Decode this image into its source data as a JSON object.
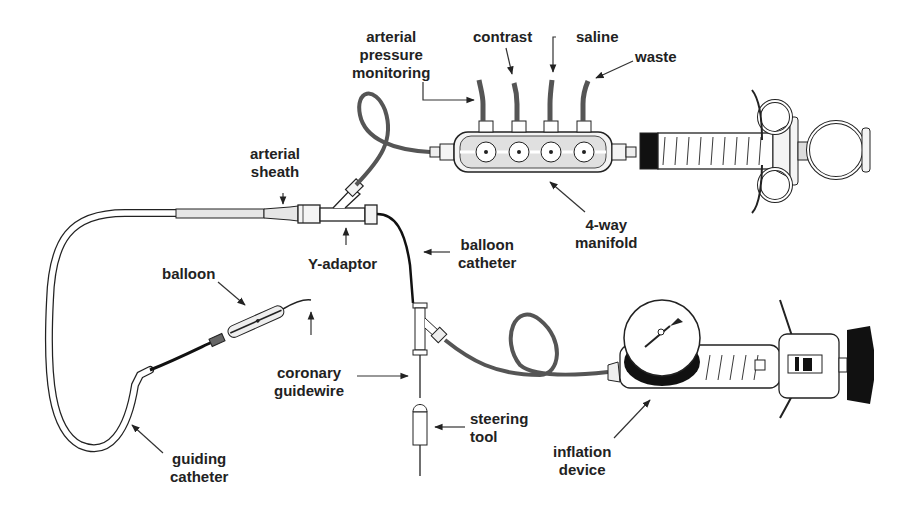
{
  "diagram": {
    "colors": {
      "ink": "#222222",
      "tube": "#555555",
      "fill_light": "#e6e6e6",
      "fill_dark": "#111111",
      "background": "#ffffff"
    },
    "labels": {
      "arterial_pressure_monitoring": {
        "line1": "arterial",
        "line2": "pressure",
        "line3": "monitoring"
      },
      "contrast": {
        "line1": "contrast"
      },
      "saline": {
        "line1": "saline"
      },
      "waste": {
        "line1": "waste"
      },
      "arterial_sheath": {
        "line1": "arterial",
        "line2": "sheath"
      },
      "y_adaptor": {
        "line1": "Y-adaptor"
      },
      "balloon_catheter": {
        "line1": "balloon",
        "line2": "catheter"
      },
      "four_way_manifold": {
        "line1": "4-way",
        "line2": "manifold"
      },
      "balloon": {
        "line1": "balloon"
      },
      "coronary_guidewire": {
        "line1": "coronary",
        "line2": "guidewire"
      },
      "steering_tool": {
        "line1": "steering",
        "line2": "tool"
      },
      "guiding_catheter": {
        "line1": "guiding",
        "line2": "catheter"
      },
      "inflation_device": {
        "line1": "inflation",
        "line2": "device"
      }
    },
    "syringe_scale": [
      "1",
      "2",
      "3",
      "4",
      "5",
      "6",
      "7",
      "8",
      "9",
      "10"
    ],
    "inflation_scale": [
      "6",
      "7",
      "8",
      "9",
      "10"
    ]
  }
}
